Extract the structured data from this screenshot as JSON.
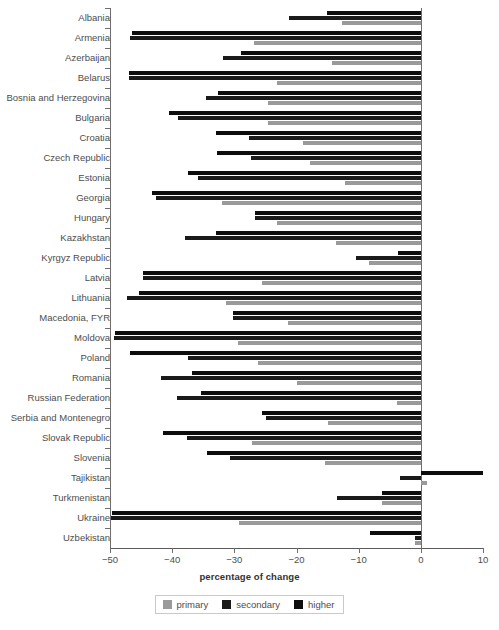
{
  "chart_data": {
    "type": "bar",
    "orientation": "horizontal",
    "title": "",
    "xlabel": "percentage of change",
    "ylabel": "",
    "xlim": [
      -50,
      10
    ],
    "xticks": [
      -50,
      -40,
      -30,
      -20,
      -10,
      0,
      10
    ],
    "xticklabels": [
      "−50",
      "−40",
      "−30",
      "−20",
      "−10",
      "0",
      "10"
    ],
    "grid": false,
    "legend_position": "bottom-center",
    "series_order": [
      "higher",
      "secondary",
      "primary"
    ],
    "colors": {
      "primary": "#9a9a9a",
      "secondary": "#1a1a1a",
      "higher": "#0d0d0d",
      "axis": "#6e6e6e",
      "text": "#4d4d4d"
    },
    "legend": [
      {
        "name": "primary",
        "color": "#9a9a9a"
      },
      {
        "name": "secondary",
        "color": "#1a1a1a"
      },
      {
        "name": "higher",
        "color": "#0d0d0d"
      }
    ],
    "categories": [
      "Albania",
      "Armenia",
      "Azerbaijan",
      "Belarus",
      "Bosnia and Herzegovina",
      "Bulgaria",
      "Croatia",
      "Czech Republic",
      "Estonia",
      "Georgia",
      "Hungary",
      "Kazakhstan",
      "Kyrgyz Republic",
      "Latvia",
      "Lithuania",
      "Macedonia, FYR",
      "Moldova",
      "Poland",
      "Romania",
      "Russian Federation",
      "Serbia and Montenegro",
      "Slovak Republic",
      "Slovenia",
      "Tajikistan",
      "Turkmenistan",
      "Ukraine",
      "Uzbekistan"
    ],
    "series": [
      {
        "name": "primary",
        "values": [
          -12.7,
          -26.9,
          -14.3,
          -23.2,
          -24.6,
          -24.6,
          -19.0,
          -17.9,
          -12.2,
          -32.0,
          -23.2,
          -13.6,
          -8.4,
          -25.6,
          -31.4,
          -21.4,
          -29.4,
          -26.2,
          -19.9,
          -3.9,
          -14.9,
          -27.2,
          -15.4,
          1.0,
          -6.3,
          -29.3,
          -1.0
        ]
      },
      {
        "name": "secondary",
        "values": [
          -21.2,
          -46.8,
          -31.8,
          -47.0,
          -34.6,
          -39.1,
          -27.7,
          -27.3,
          -35.9,
          -42.6,
          -26.6,
          -38.0,
          -10.5,
          -44.7,
          -47.3,
          -30.2,
          -49.3,
          -37.5,
          -41.8,
          -39.2,
          -24.9,
          -37.6,
          -30.7,
          -3.4,
          -13.5,
          -49.8,
          -1.0
        ]
      },
      {
        "name": "higher",
        "values": [
          -15.1,
          -46.5,
          -29.0,
          -47.0,
          -32.6,
          -40.5,
          -33.0,
          -32.8,
          -37.5,
          -43.3,
          -26.6,
          -33.0,
          -3.7,
          -44.7,
          -45.3,
          -30.2,
          -49.2,
          -46.8,
          -36.8,
          -35.4,
          -25.6,
          -41.5,
          -34.4,
          10.0,
          -6.3,
          -49.7,
          -8.1
        ]
      }
    ]
  }
}
